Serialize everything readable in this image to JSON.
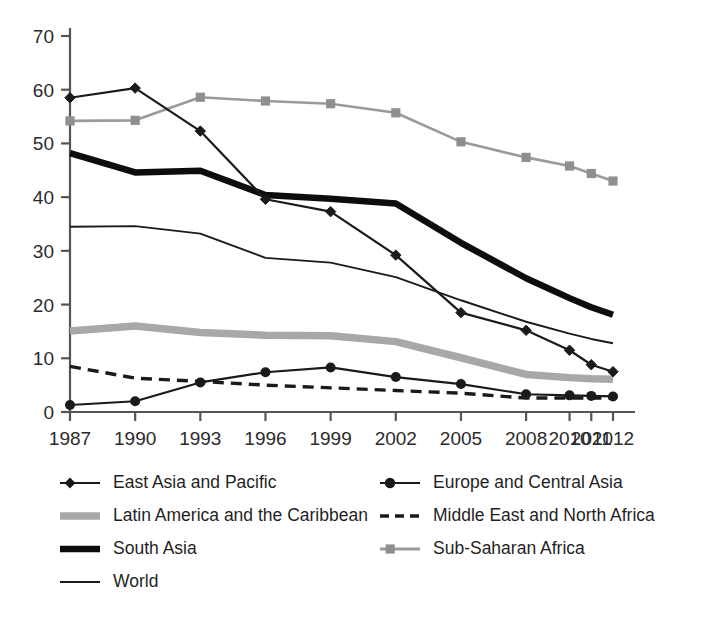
{
  "chart_data": {
    "type": "line",
    "title": "",
    "subtitle": "",
    "xlabel": "",
    "ylabel": "",
    "xlim": [
      0,
      10
    ],
    "ylim": [
      0,
      70
    ],
    "grid": false,
    "legend_position": "bottom",
    "categories": [
      "1987",
      "1990",
      "1993",
      "1996",
      "1999",
      "2002",
      "2005",
      "2008",
      "2010",
      "2011",
      "2012"
    ],
    "x_tick_labels": [
      "1987",
      "1990",
      "1993",
      "1996",
      "1999",
      "2002",
      "2005",
      "2008",
      "2010",
      "2011",
      "2012"
    ],
    "y_tick_labels": [
      "0",
      "10",
      "20",
      "30",
      "40",
      "50",
      "60",
      "70"
    ],
    "y_ticks": [
      0,
      10,
      20,
      30,
      40,
      50,
      60,
      70
    ],
    "series": [
      {
        "name": "East Asia and Pacific",
        "marker": "diamond",
        "style": "solid-thin-marker",
        "color": "#1a1a1a",
        "values": [
          58.5,
          60.3,
          52.3,
          39.6,
          37.3,
          29.2,
          18.5,
          15.2,
          11.5,
          8.8,
          7.5
        ]
      },
      {
        "name": "Europe and Central Asia",
        "marker": "circle",
        "style": "solid-thin-marker",
        "color": "#1a1a1a",
        "values": [
          1.3,
          2.0,
          5.5,
          7.4,
          8.3,
          6.5,
          5.2,
          3.3,
          3.1,
          3.0,
          2.9
        ]
      },
      {
        "name": "Latin America and the Caribbean",
        "marker": "none",
        "style": "solid-thick-gray",
        "color": "#a8a8a8",
        "values": [
          15.1,
          16.0,
          14.8,
          14.3,
          14.2,
          13.1,
          10.1,
          7.0,
          6.4,
          6.2,
          6.1
        ]
      },
      {
        "name": "Middle East and North Africa",
        "marker": "none",
        "style": "dashed",
        "color": "#1a1a1a",
        "values": [
          8.5,
          6.3,
          5.7,
          5.0,
          4.5,
          4.0,
          3.5,
          2.6,
          2.6,
          2.6,
          2.6
        ]
      },
      {
        "name": "South Asia",
        "marker": "none",
        "style": "solid-thick-black",
        "color": "#0d0d0d",
        "values": [
          48.2,
          44.6,
          44.9,
          40.4,
          39.7,
          38.8,
          31.5,
          24.9,
          21.2,
          19.5,
          18.1
        ]
      },
      {
        "name": "Sub-Saharan Africa",
        "marker": "square",
        "style": "solid-gray-marker",
        "color": "#9a9a9a",
        "values": [
          54.2,
          54.3,
          58.6,
          57.9,
          57.4,
          55.7,
          50.3,
          47.4,
          45.8,
          44.4,
          43.0
        ]
      },
      {
        "name": "World",
        "marker": "none",
        "style": "solid-thin-black",
        "color": "#1a1a1a",
        "values": [
          34.5,
          34.6,
          33.2,
          28.7,
          27.8,
          25.1,
          20.8,
          16.8,
          14.6,
          13.6,
          12.8
        ]
      }
    ]
  },
  "legend": {
    "entries": [
      {
        "label": "East Asia and Pacific",
        "swatch": "diamond-marker-line"
      },
      {
        "label": "Europe and Central Asia",
        "swatch": "circle-marker-line"
      },
      {
        "label": "Latin America and the Caribbean",
        "swatch": "thick-gray-line"
      },
      {
        "label": "Middle East and North Africa",
        "swatch": "dashed-black-line"
      },
      {
        "label": "South Asia",
        "swatch": "thick-black-line"
      },
      {
        "label": "Sub-Saharan Africa",
        "swatch": "gray-square-marker-line"
      },
      {
        "label": "World",
        "swatch": "thin-black-line"
      }
    ]
  },
  "colors": {
    "axis": "#555555",
    "text": "#1f1f1f",
    "black_series": "#1a1a1a",
    "gray_series": "#9a9a9a",
    "light_gray_series": "#a8a8a8",
    "background": "#ffffff"
  }
}
